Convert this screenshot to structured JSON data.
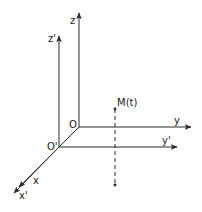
{
  "diagram": {
    "colors": {
      "stroke": "#2a2a2a",
      "background": "#ffffff"
    },
    "frames": [
      {
        "origin_label": "O",
        "axes": [
          {
            "name": "x",
            "label": "x"
          },
          {
            "name": "y",
            "label": "y"
          },
          {
            "name": "z",
            "label": "z"
          }
        ]
      },
      {
        "origin_label": "O'",
        "axes": [
          {
            "name": "x'",
            "label": "x'"
          },
          {
            "name": "y'",
            "label": "y'"
          },
          {
            "name": "z'",
            "label": "z'"
          }
        ]
      }
    ],
    "point": {
      "label": "M(t)",
      "style": "dashed vertical projection"
    }
  }
}
